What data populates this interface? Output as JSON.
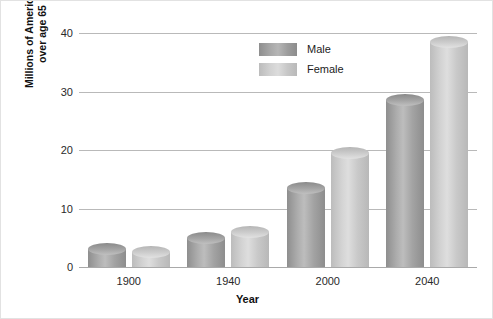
{
  "chart_data": {
    "type": "bar",
    "title": "",
    "xlabel": "Year",
    "ylabel_lines": [
      "Millions of Americans",
      "over age 65"
    ],
    "categories": [
      "1900",
      "1940",
      "2000",
      "2040"
    ],
    "series": [
      {
        "name": "Male",
        "color": "#9a9a9a",
        "values": [
          3,
          5,
          13.5,
          28.5
        ]
      },
      {
        "name": "Female",
        "color": "#c8c8c8",
        "values": [
          2.5,
          6,
          19.5,
          38.5
        ]
      }
    ],
    "ylim": [
      0,
      40
    ],
    "yticks": [
      "0",
      "10",
      "20",
      "30",
      "40"
    ],
    "ytick_values": [
      0,
      10,
      20,
      30,
      40
    ],
    "grid": true,
    "legend_position": "top-center"
  }
}
